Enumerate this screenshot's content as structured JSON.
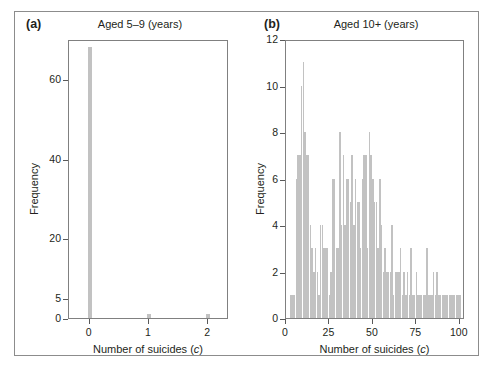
{
  "figure": {
    "background": "#ffffff",
    "bar_color": "#c2c2c2",
    "axis_color": "#808080",
    "text_color": "#231f20"
  },
  "panels": {
    "a": {
      "tag": "(a)",
      "title": "Aged 5–9 (years)",
      "xlabel_main": "Number of suicides (",
      "xlabel_italic": "c",
      "xlabel_close": ")",
      "ylabel": "Frequency"
    },
    "b": {
      "tag": "(b)",
      "title": "Aged 10+ (years)",
      "xlabel_main": "Number of suicides (",
      "xlabel_italic": "c",
      "xlabel_close": ")",
      "ylabel": "Frequency"
    }
  },
  "chart_data": [
    {
      "type": "bar",
      "panel": "a",
      "title": "Aged 5–9 (years)",
      "xlabel": "Number of suicides (c)",
      "ylabel": "Frequency",
      "xlim": [
        -0.35,
        2.35
      ],
      "ylim": [
        0,
        70
      ],
      "xticks": [
        0,
        1,
        2
      ],
      "xtick_labels": [
        "0",
        "1",
        "2"
      ],
      "yticks": [
        0,
        5,
        20,
        40,
        60
      ],
      "ytick_labels": [
        "0",
        "5",
        "20",
        "40",
        "60"
      ],
      "grid": false,
      "legend": null,
      "categories": [
        0,
        1,
        2
      ],
      "values": [
        68,
        1,
        1
      ]
    },
    {
      "type": "bar",
      "panel": "b",
      "title": "Aged 10+ (years)",
      "xlabel": "Number of suicides (c)",
      "ylabel": "Frequency",
      "xlim": [
        0,
        103
      ],
      "ylim": [
        0,
        12
      ],
      "xticks": [
        0,
        25,
        50,
        75,
        100
      ],
      "xtick_labels": [
        "0",
        "25",
        "50",
        "75",
        "100"
      ],
      "yticks": [
        0,
        2,
        4,
        6,
        8,
        10,
        12
      ],
      "ytick_labels": [
        "0",
        "2",
        "4",
        "6",
        "8",
        "10",
        "12"
      ],
      "grid": false,
      "legend": null,
      "categories": [
        3,
        4,
        5,
        6,
        7,
        8,
        9,
        10,
        11,
        12,
        13,
        14,
        15,
        16,
        17,
        18,
        19,
        20,
        21,
        22,
        23,
        24,
        25,
        26,
        27,
        28,
        29,
        30,
        31,
        32,
        33,
        34,
        35,
        36,
        37,
        38,
        39,
        40,
        41,
        42,
        43,
        44,
        45,
        46,
        47,
        48,
        49,
        50,
        51,
        52,
        53,
        54,
        55,
        56,
        57,
        58,
        59,
        60,
        61,
        62,
        63,
        64,
        65,
        66,
        67,
        68,
        69,
        70,
        71,
        72,
        73,
        74,
        75,
        76,
        77,
        78,
        79,
        80,
        81,
        82,
        83,
        84,
        85,
        86,
        87,
        88,
        89,
        90,
        91,
        92,
        93,
        94,
        95,
        96,
        97,
        98,
        99,
        100
      ],
      "values": [
        1,
        1,
        1,
        6,
        7,
        7,
        10,
        11,
        8,
        7,
        7,
        4,
        3,
        2,
        3,
        2,
        1,
        4,
        4,
        3,
        3,
        3,
        1,
        2,
        6,
        6,
        3,
        3,
        8,
        4,
        7,
        4,
        6,
        6,
        5,
        7,
        4,
        6,
        5,
        5,
        3,
        6,
        7,
        7,
        3,
        8,
        7,
        6,
        5,
        5,
        3,
        6,
        4,
        2,
        3,
        2,
        2,
        2,
        4,
        1,
        2,
        2,
        2,
        3,
        1,
        2,
        1,
        2,
        1,
        3,
        1,
        1,
        2,
        1,
        1,
        1,
        1,
        1,
        3,
        1,
        1,
        1,
        2,
        1,
        2,
        1,
        1,
        1,
        1,
        1,
        1,
        1,
        1,
        1,
        1,
        1,
        1,
        1
      ]
    }
  ]
}
